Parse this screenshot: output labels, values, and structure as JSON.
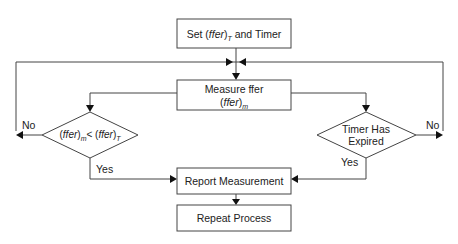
{
  "diagram": {
    "type": "flowchart",
    "nodes": {
      "set": {
        "kind": "process",
        "prefix": "Set (",
        "var": "ffer",
        "close": ")",
        "subscript": "T",
        "suffix": " and Timer"
      },
      "measure": {
        "kind": "process",
        "line1": "Measure ffer",
        "line2_open": "(",
        "line2_var": "ffer",
        "line2_close": ")",
        "line2_sub": "m"
      },
      "compare": {
        "kind": "decision",
        "open1": "(",
        "var1": "ffer",
        "close1": ")",
        "sub1": "m",
        "op": "< (",
        "var2": "ffer",
        "close2": ")",
        "sub2": "T"
      },
      "timer": {
        "kind": "decision",
        "line1": "Timer Has",
        "line2": "Expired"
      },
      "report": {
        "kind": "process",
        "label": "Report Measurement"
      },
      "repeat": {
        "kind": "process",
        "label": "Repeat Process"
      }
    },
    "edge_labels": {
      "compare_no": "No",
      "compare_yes": "Yes",
      "timer_no": "No",
      "timer_yes": "Yes"
    },
    "edges": [
      {
        "from": "set",
        "to": "measure"
      },
      {
        "from": "measure",
        "to": "compare"
      },
      {
        "from": "measure",
        "to": "timer"
      },
      {
        "from": "compare",
        "to": "measure",
        "label": "No"
      },
      {
        "from": "compare",
        "to": "report",
        "label": "Yes"
      },
      {
        "from": "timer",
        "to": "measure",
        "label": "No"
      },
      {
        "from": "timer",
        "to": "report",
        "label": "Yes"
      },
      {
        "from": "report",
        "to": "repeat"
      }
    ],
    "colors": {
      "stroke": "#444444",
      "text": "#222222",
      "background": "#ffffff"
    }
  }
}
